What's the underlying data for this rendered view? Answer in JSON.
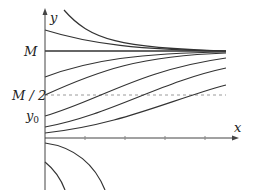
{
  "diagram": {
    "axes": {
      "x_label": "x",
      "y_label": "y"
    },
    "y_labels": {
      "M": "M",
      "M_half": "M / 2",
      "y0": "y",
      "y0_sub": "0"
    },
    "colors": {
      "curve": "#333333",
      "axis": "#444444",
      "dashed": "#9a9a9a",
      "background": "#ffffff"
    },
    "x_ticks": [
      85,
      125,
      165,
      205
    ],
    "curves": [
      {
        "name": "curve-above-steep",
        "d": "M64,10 C90,40 120,48 226,51"
      },
      {
        "name": "curve-above-shallow",
        "d": "M45,30 C90,44 140,50 226,51"
      },
      {
        "name": "curve-equilibrium-M",
        "d": "M45,51 L226,51"
      },
      {
        "name": "curve-below-1",
        "d": "M45,77 C90,60 140,53 226,52"
      },
      {
        "name": "curve-below-2",
        "d": "M45,95 C100,70 140,56 226,53"
      },
      {
        "name": "curve-y0",
        "d": "M45,116 C100,100 140,70 226,58"
      },
      {
        "name": "curve-below-4",
        "d": "M45,127 C110,115 160,82 226,68"
      },
      {
        "name": "curve-below-5",
        "d": "M45,133 C120,125 170,100 226,85"
      },
      {
        "name": "curve-negative-1",
        "d": "M45,143 C75,147 95,165 105,190"
      },
      {
        "name": "curve-negative-2",
        "d": "M45,162 C55,170 62,182 65,190"
      }
    ]
  }
}
